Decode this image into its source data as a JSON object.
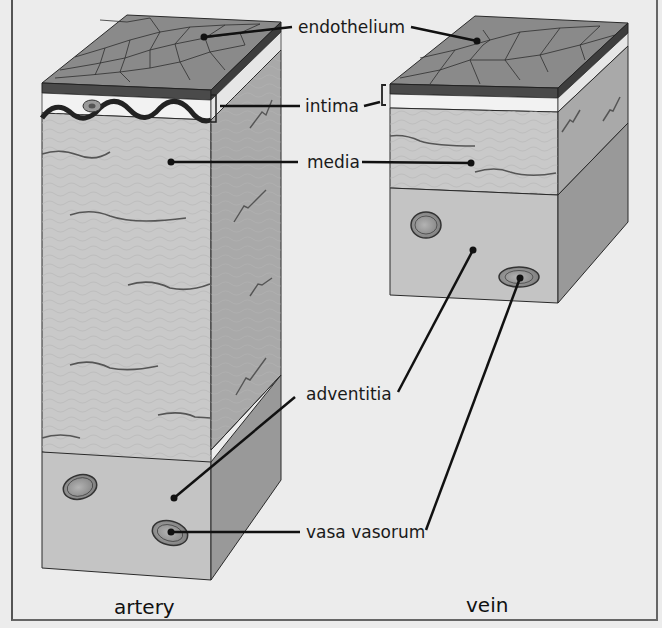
{
  "labels": {
    "endothelium": "endothelium",
    "intima": "intima",
    "media": "media",
    "adventitia": "adventitia",
    "vasa_vasorum": "vasa vasorum"
  },
  "captions": {
    "artery": "artery",
    "vein": "vein"
  },
  "colors": {
    "background": "#ececec",
    "top_surface": "#8a8a8a",
    "endothelium_band": "#4a4a4a",
    "intima_white": "#f2f2f2",
    "media_front": "#c9c9c9",
    "media_side": "#a9a9a9",
    "adventitia_front": "#c4c4c4",
    "adventitia_side": "#9a9a9a",
    "outline": "#2a2a2a"
  }
}
